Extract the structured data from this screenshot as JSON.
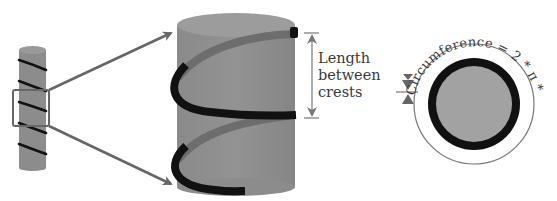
{
  "diagram": {
    "pitch_label": {
      "lines": [
        "Length",
        "between",
        "crests"
      ]
    },
    "circumference_label": "Circumference = 2 * π * radius",
    "colors": {
      "cylinder_fill": "#8e8e8e",
      "cylinder_top": "#9a9a9a",
      "helix_front": "#111111",
      "helix_back": "#6a6a6a",
      "arrow": "#666666",
      "circle_fill": "#a0a0a0",
      "circle_ring": "#111111",
      "outline": "#777777"
    },
    "elements": [
      {
        "name": "small-cylinder",
        "description": "Thin cylinder wrapped by a helical strand"
      },
      {
        "name": "zoom-box",
        "description": "Highlight rectangle on the small cylinder"
      },
      {
        "name": "zoom-arrows",
        "description": "Two arrows pointing to the enlarged cylinder"
      },
      {
        "name": "large-cylinder",
        "description": "Enlarged cylinder section with helix"
      },
      {
        "name": "pitch-dimension",
        "description": "Double-headed arrow showing length between crests"
      },
      {
        "name": "cross-section",
        "description": "Circular cross-section with circumference arc"
      }
    ]
  }
}
